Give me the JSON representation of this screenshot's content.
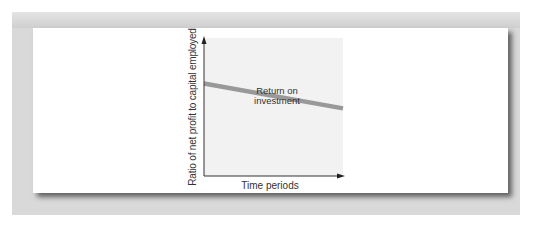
{
  "chart_data": {
    "type": "line",
    "title": "",
    "xlabel": "Time periods",
    "ylabel": "Ratio of net profit to capital employed",
    "x": [
      0,
      1
    ],
    "series": [
      {
        "name": "Return on investment",
        "values": [
          0.67,
          0.49
        ],
        "color": "#999999"
      }
    ],
    "annotations": [
      {
        "text": "Return on investment",
        "position": "above line, center"
      }
    ],
    "grid": false,
    "legend": "none",
    "xlim": [
      0,
      1
    ],
    "ylim": [
      0,
      1
    ],
    "ticks": "none"
  },
  "labels": {
    "y_axis": "Ratio of net profit to capital employed",
    "x_axis": "Time periods",
    "series_line1": "Return on",
    "series_line2": "investment"
  },
  "colors": {
    "frame": "#d9d9d9",
    "plot_background": "#f2f2f2",
    "line": "#999999",
    "axis": "#333333"
  }
}
